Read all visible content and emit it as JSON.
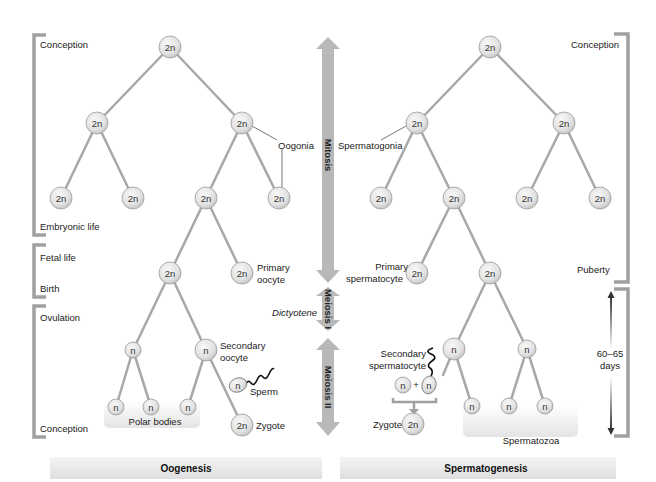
{
  "colors": {
    "node_fill_center": "#f4f4f4",
    "node_fill_edge": "#cfcfcf",
    "node_stroke": "#9a9a9a",
    "branch_line": "#a8a8a8",
    "bracket": "#a0a0a0",
    "arrow_fill": "#b8b8b8",
    "band_fill": "#e6e6e6",
    "text": "#222222"
  },
  "center_arrows": {
    "mitosis": "Mitosis",
    "meiosis_1": "Meiosis I",
    "meiosis_2": "Meiosis II",
    "dictyotene": "Dictyotene"
  },
  "oogenesis": {
    "title": "Oogenesis",
    "timeline": {
      "conception_top": "Conception",
      "embryonic_life": "Embryonic life",
      "fetal_life": "Fetal life",
      "birth": "Birth",
      "ovulation": "Ovulation",
      "conception_bottom": "Conception"
    },
    "labels": {
      "oogonia": "Oogonia",
      "primary_oocyte_1": "Primary",
      "primary_oocyte_2": "oocyte",
      "secondary_oocyte_1": "Secondary",
      "secondary_oocyte_2": "oocyte",
      "sperm": "Sperm",
      "polar_bodies": "Polar bodies",
      "zygote": "Zygote"
    },
    "nodes": [
      {
        "id": "o-root",
        "ploidy": "2n"
      },
      {
        "id": "o-l1-a",
        "ploidy": "2n"
      },
      {
        "id": "o-l1-b",
        "ploidy": "2n"
      },
      {
        "id": "o-l2-a",
        "ploidy": "2n"
      },
      {
        "id": "o-l2-b",
        "ploidy": "2n"
      },
      {
        "id": "o-l2-c",
        "ploidy": "2n"
      },
      {
        "id": "o-l2-d",
        "ploidy": "2n"
      },
      {
        "id": "o-l3-a",
        "ploidy": "2n"
      },
      {
        "id": "o-l3-b",
        "ploidy": "2n"
      },
      {
        "id": "o-l4-a",
        "ploidy": "n"
      },
      {
        "id": "o-l4-b",
        "ploidy": "n"
      },
      {
        "id": "o-l5-a",
        "ploidy": "n"
      },
      {
        "id": "o-l5-b",
        "ploidy": "n"
      },
      {
        "id": "o-l5-c",
        "ploidy": "n"
      },
      {
        "id": "o-sperm",
        "ploidy": "n"
      },
      {
        "id": "o-zygote",
        "ploidy": "2n"
      }
    ]
  },
  "spermatogenesis": {
    "title": "Spermatogenesis",
    "timeline": {
      "conception": "Conception",
      "puberty": "Puberty",
      "duration_1": "60–65",
      "duration_2": "days"
    },
    "labels": {
      "spermatogonia": "Spermatogonia",
      "primary_spermatocyte_1": "Primary",
      "primary_spermatocyte_2": "spermatocyte",
      "secondary_spermatocyte_1": "Secondary",
      "secondary_spermatocyte_2": "spermatocyte",
      "plus": "+",
      "zygote": "Zygote",
      "spermatozoa": "Spermatozoa"
    },
    "nodes": [
      {
        "id": "s-root",
        "ploidy": "2n"
      },
      {
        "id": "s-l1-a",
        "ploidy": "2n"
      },
      {
        "id": "s-l1-b",
        "ploidy": "2n"
      },
      {
        "id": "s-l2-a",
        "ploidy": "2n"
      },
      {
        "id": "s-l2-b",
        "ploidy": "2n"
      },
      {
        "id": "s-l2-c",
        "ploidy": "2n"
      },
      {
        "id": "s-l2-d",
        "ploidy": "2n"
      },
      {
        "id": "s-l3-a",
        "ploidy": "2n"
      },
      {
        "id": "s-l3-b",
        "ploidy": "2n"
      },
      {
        "id": "s-l4-a",
        "ploidy": "n"
      },
      {
        "id": "s-l4-b",
        "ploidy": "n"
      },
      {
        "id": "s-l5-a",
        "ploidy": "n"
      },
      {
        "id": "s-l5-b",
        "ploidy": "n"
      },
      {
        "id": "s-l5-c",
        "ploidy": "n"
      },
      {
        "id": "s-egg",
        "ploidy": "n"
      },
      {
        "id": "s-sperm",
        "ploidy": "n"
      },
      {
        "id": "s-zygote",
        "ploidy": "2n"
      }
    ]
  }
}
